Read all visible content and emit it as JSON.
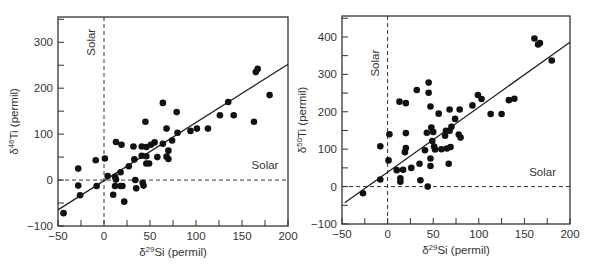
{
  "chart_data": [
    {
      "type": "scatter",
      "title": "",
      "xlabel": "δ29Si (permil)",
      "xlabel_parts": {
        "prefix": "δ",
        "sup": "29",
        "rest": "Si (permil)"
      },
      "ylabel": "δ46Ti (permil)",
      "ylabel_parts": {
        "prefix": "δ",
        "sup": "46",
        "rest": "Ti (permil)"
      },
      "xlim": [
        -50,
        200
      ],
      "ylim": [
        -100,
        355
      ],
      "xticks": [
        -50,
        0,
        50,
        100,
        150,
        200
      ],
      "yticks": [
        -100,
        0,
        100,
        200,
        300
      ],
      "grid": false,
      "legend": null,
      "annotations": [
        {
          "text": "Solar",
          "orientation": "vertical",
          "x": 0,
          "y": 300,
          "note": "dashed vertical line at x=0"
        },
        {
          "text": "Solar",
          "orientation": "horizontal",
          "x": 175,
          "y": 25,
          "note": "dashed horizontal line at y=0"
        }
      ],
      "reference_lines": {
        "vertical_x": 0,
        "horizontal_y": 0,
        "style": "dashed"
      },
      "fit_line": {
        "x": [
          -50,
          200
        ],
        "y": [
          -65,
          252
        ]
      },
      "series": [
        {
          "name": "SiC grains",
          "points": [
            [
              -44,
              -72
            ],
            [
              -28,
              25
            ],
            [
              -28,
              -12
            ],
            [
              -26,
              -33
            ],
            [
              -9,
              43
            ],
            [
              -8,
              -13
            ],
            [
              1,
              47
            ],
            [
              4,
              9
            ],
            [
              10,
              -32
            ],
            [
              13,
              83
            ],
            [
              12,
              7
            ],
            [
              13,
              1
            ],
            [
              12,
              -13
            ],
            [
              18,
              17
            ],
            [
              19,
              77
            ],
            [
              18,
              -13
            ],
            [
              20,
              -13
            ],
            [
              22,
              -47
            ],
            [
              27,
              30
            ],
            [
              32,
              73
            ],
            [
              33,
              45
            ],
            [
              34,
              0
            ],
            [
              35,
              -18
            ],
            [
              41,
              73
            ],
            [
              41,
              53
            ],
            [
              42,
              -6
            ],
            [
              43,
              -12
            ],
            [
              45,
              127
            ],
            [
              46,
              72
            ],
            [
              46,
              52
            ],
            [
              46,
              36
            ],
            [
              49,
              36
            ],
            [
              51,
              77
            ],
            [
              55,
              82
            ],
            [
              58,
              50
            ],
            [
              64,
              168
            ],
            [
              64,
              79
            ],
            [
              68,
              112
            ],
            [
              68,
              51
            ],
            [
              70,
              64
            ],
            [
              70,
              46
            ],
            [
              74,
              86
            ],
            [
              79,
              148
            ],
            [
              80,
              103
            ],
            [
              94,
              107
            ],
            [
              101,
              112
            ],
            [
              113,
              112
            ],
            [
              126,
              141
            ],
            [
              135,
              170
            ],
            [
              141,
              141
            ],
            [
              163,
              127
            ],
            [
              165,
              235
            ],
            [
              167,
              242
            ],
            [
              180,
              185
            ]
          ]
        }
      ]
    },
    {
      "type": "scatter",
      "title": "",
      "xlabel": "δ29Si (permil)",
      "xlabel_parts": {
        "prefix": "δ",
        "sup": "29",
        "rest": "Si (permil)"
      },
      "ylabel": "δ50Ti (permil)",
      "ylabel_parts": {
        "prefix": "δ",
        "sup": "50",
        "rest": "Ti (permil)"
      },
      "xlim": [
        -50,
        200
      ],
      "ylim": [
        -100,
        456
      ],
      "xticks": [
        -50,
        0,
        50,
        100,
        150,
        200
      ],
      "yticks": [
        -100,
        0,
        100,
        200,
        300,
        400
      ],
      "grid": false,
      "legend": null,
      "annotations": [
        {
          "text": "Solar",
          "orientation": "vertical",
          "x": 0,
          "y": 330,
          "note": "dashed vertical line at x=0"
        },
        {
          "text": "Solar",
          "orientation": "horizontal",
          "x": 170,
          "y": 28,
          "note": "dashed horizontal line at y=0"
        }
      ],
      "reference_lines": {
        "vertical_x": 0,
        "horizontal_y": 0,
        "style": "dashed"
      },
      "fit_line": {
        "x": [
          -47,
          200
        ],
        "y": [
          -43,
          386
        ]
      },
      "series": [
        {
          "name": "SiC grains",
          "points": [
            [
              -27,
              -18
            ],
            [
              -8,
              19
            ],
            [
              -8,
              108
            ],
            [
              1,
              70
            ],
            [
              2,
              140
            ],
            [
              10,
              44
            ],
            [
              13,
              227
            ],
            [
              14,
              13
            ],
            [
              14,
              22
            ],
            [
              17,
              45
            ],
            [
              20,
              223
            ],
            [
              19,
              92
            ],
            [
              20,
              103
            ],
            [
              20,
              143
            ],
            [
              26,
              50
            ],
            [
              32,
              258
            ],
            [
              35,
              61
            ],
            [
              36,
              17
            ],
            [
              41,
              97
            ],
            [
              43,
              144
            ],
            [
              44,
              0
            ],
            [
              45,
              278
            ],
            [
              45,
              251
            ],
            [
              47,
              214
            ],
            [
              47,
              55
            ],
            [
              47,
              75
            ],
            [
              48,
              158
            ],
            [
              49,
              122
            ],
            [
              50,
              146
            ],
            [
              51,
              107
            ],
            [
              52,
              99
            ],
            [
              56,
              195
            ],
            [
              59,
              100
            ],
            [
              63,
              136
            ],
            [
              64,
              149
            ],
            [
              65,
              102
            ],
            [
              67,
              61
            ],
            [
              68,
              206
            ],
            [
              68,
              149
            ],
            [
              69,
              106
            ],
            [
              70,
              160
            ],
            [
              74,
              181
            ],
            [
              79,
              206
            ],
            [
              78,
              139
            ],
            [
              80,
              131
            ],
            [
              93,
              217
            ],
            [
              99,
              245
            ],
            [
              103,
              234
            ],
            [
              113,
              194
            ],
            [
              125,
              194
            ],
            [
              133,
              231
            ],
            [
              139,
              235
            ],
            [
              161,
              396
            ],
            [
              165,
              380
            ],
            [
              167,
              384
            ],
            [
              180,
              337
            ]
          ]
        }
      ]
    }
  ],
  "colors": {
    "axis": "#333333",
    "points": "#111111",
    "line": "#222222",
    "background": "#ffffff"
  }
}
